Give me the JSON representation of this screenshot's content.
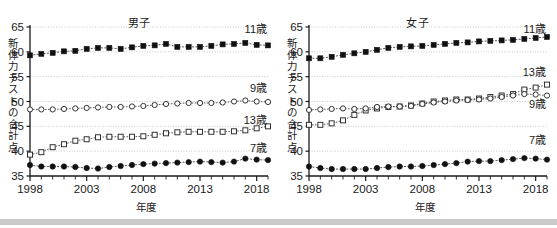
{
  "figure": {
    "bottom_bar_color": "#c9c9c9",
    "background": "#ffffff",
    "axis_color": "#1a1a1a",
    "grid_color": "#bfbfbf"
  },
  "panels": [
    {
      "key": "boys",
      "title": "男子",
      "ylabel_chars": [
        "新",
        "体",
        "力",
        "テ",
        "ス",
        "ト",
        "の",
        "合",
        "計",
        "点"
      ],
      "xlabel": "年度",
      "series_labels": {
        "age11": "11歳",
        "age9": "9歳",
        "age13": "13歳",
        "age7": "7歳"
      }
    },
    {
      "key": "girls",
      "title": "女子",
      "ylabel_chars": [
        "新",
        "体",
        "力",
        "テ",
        "ス",
        "ト",
        "の",
        "合",
        "計",
        "点"
      ],
      "xlabel": "年度",
      "series_labels": {
        "age11": "11歳",
        "age13": "13歳",
        "age9": "9歳",
        "age7": "7歳"
      }
    }
  ],
  "chart_data": [
    {
      "type": "line",
      "title": "男子",
      "xlabel": "年度",
      "ylabel": "新体力テストの合計点",
      "ylim": [
        35,
        65
      ],
      "yticks": [
        35,
        40,
        45,
        50,
        55,
        60,
        65
      ],
      "xlim": [
        1998,
        2019
      ],
      "xticks_major": [
        1998,
        2003,
        2008,
        2013,
        2018
      ],
      "xticks_minor_every": 1,
      "grid": "horizontal-dotted",
      "legend": "inline-right-labels",
      "x": [
        1998,
        1999,
        2000,
        2001,
        2002,
        2003,
        2004,
        2005,
        2006,
        2007,
        2008,
        2009,
        2010,
        2011,
        2012,
        2013,
        2014,
        2015,
        2016,
        2017,
        2018,
        2019
      ],
      "series": [
        {
          "name": "11歳",
          "marker": "filled-square",
          "values": [
            59.3,
            59.6,
            59.8,
            60.1,
            60.2,
            60.6,
            60.8,
            60.8,
            60.6,
            60.9,
            61.2,
            61.3,
            61.6,
            61.0,
            61.0,
            61.0,
            61.2,
            61.5,
            61.6,
            61.8,
            61.4,
            61.3
          ]
        },
        {
          "name": "9歳",
          "marker": "open-circle",
          "values": [
            48.4,
            48.4,
            48.4,
            48.5,
            48.6,
            48.7,
            48.8,
            48.9,
            48.9,
            49.0,
            49.1,
            49.3,
            49.5,
            49.6,
            49.7,
            49.7,
            49.7,
            49.8,
            50.0,
            50.2,
            50.0,
            49.9
          ]
        },
        {
          "name": "13歳",
          "marker": "open-square",
          "values": [
            39.3,
            39.8,
            40.8,
            41.4,
            42.1,
            42.4,
            42.8,
            42.9,
            42.9,
            42.9,
            43.0,
            43.3,
            43.6,
            43.8,
            43.9,
            43.9,
            43.9,
            43.9,
            44.0,
            44.2,
            44.6,
            45.0
          ]
        },
        {
          "name": "7歳",
          "marker": "filled-circle",
          "values": [
            37.2,
            36.9,
            36.9,
            36.9,
            36.8,
            36.6,
            36.5,
            36.8,
            37.0,
            37.2,
            37.4,
            37.5,
            37.6,
            37.7,
            37.8,
            37.9,
            37.8,
            37.7,
            37.9,
            38.5,
            38.3,
            38.2
          ]
        }
      ]
    },
    {
      "type": "line",
      "title": "女子",
      "xlabel": "年度",
      "ylabel": "新体力テストの合計点",
      "ylim": [
        35,
        65
      ],
      "yticks": [
        35,
        40,
        45,
        50,
        55,
        60,
        65
      ],
      "xlim": [
        1998,
        2019
      ],
      "xticks_major": [
        1998,
        2003,
        2008,
        2013,
        2018
      ],
      "xticks_minor_every": 1,
      "grid": "horizontal-dotted",
      "legend": "inline-right-labels",
      "x": [
        1998,
        1999,
        2000,
        2001,
        2002,
        2003,
        2004,
        2005,
        2006,
        2007,
        2008,
        2009,
        2010,
        2011,
        2012,
        2013,
        2014,
        2015,
        2016,
        2017,
        2018,
        2019
      ],
      "series": [
        {
          "name": "11歳",
          "marker": "filled-square",
          "values": [
            58.7,
            58.7,
            59.0,
            59.4,
            59.7,
            60.0,
            60.4,
            60.8,
            61.0,
            61.1,
            61.2,
            61.4,
            61.6,
            61.8,
            61.9,
            62.1,
            62.2,
            62.3,
            62.4,
            62.6,
            62.8,
            63.0
          ]
        },
        {
          "name": "13歳",
          "marker": "open-square",
          "values": [
            45.3,
            45.3,
            45.6,
            46.2,
            47.3,
            48.2,
            48.6,
            48.9,
            49.0,
            49.2,
            49.6,
            50.0,
            50.2,
            50.4,
            50.4,
            50.6,
            50.9,
            51.2,
            51.5,
            52.4,
            52.8,
            53.4
          ]
        },
        {
          "name": "9歳",
          "marker": "open-circle",
          "values": [
            48.3,
            48.4,
            48.5,
            48.6,
            48.5,
            48.6,
            48.9,
            49.0,
            49.0,
            49.1,
            49.5,
            49.8,
            50.0,
            50.2,
            50.3,
            50.4,
            50.6,
            50.9,
            51.2,
            51.5,
            51.4,
            51.2
          ]
        },
        {
          "name": "7歳",
          "marker": "filled-circle",
          "values": [
            36.9,
            36.6,
            36.4,
            36.4,
            36.4,
            36.4,
            36.6,
            36.8,
            36.9,
            36.9,
            37.0,
            37.2,
            37.4,
            37.6,
            37.9,
            38.0,
            38.0,
            38.2,
            38.4,
            38.6,
            38.5,
            38.3
          ]
        }
      ]
    }
  ]
}
